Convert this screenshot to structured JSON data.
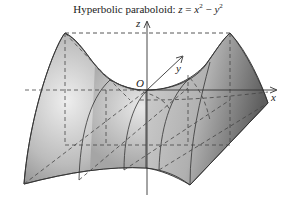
{
  "figure": {
    "title_prefix": "Hyperbolic paraboloid: ",
    "equation": {
      "lhs": "z",
      "eq": " = ",
      "x": "x",
      "x_exp": "2",
      "minus": " − ",
      "y": "y",
      "y_exp": "2"
    },
    "axes": {
      "x_label": "x",
      "y_label": "y",
      "z_label": "z",
      "origin_label": "O"
    },
    "colors": {
      "surface_light": "#e6e6e6",
      "surface_mid": "#b4b4b4",
      "surface_dark": "#6e6e6e",
      "line": "#333333",
      "dashed": "#444444"
    }
  }
}
